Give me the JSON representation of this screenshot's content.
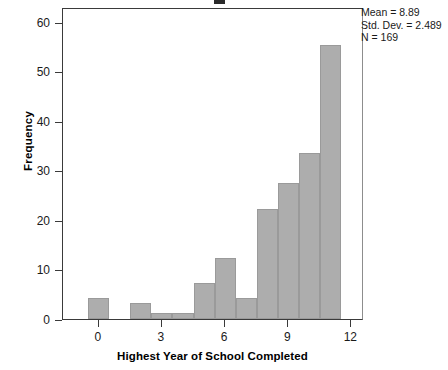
{
  "chart_data": {
    "type": "bar",
    "title_visible": false,
    "xlabel": "Highest Year of School Completed",
    "ylabel": "Frequency",
    "xlim": [
      -1.7,
      12.6
    ],
    "ylim": [
      0,
      63
    ],
    "grid": false,
    "legend": null,
    "bin_width": 1,
    "x_ticks": [
      0,
      3,
      6,
      9,
      12
    ],
    "x_tick_labels": [
      "0",
      "3",
      "6",
      "9",
      "12"
    ],
    "y_ticks": [
      0,
      10,
      20,
      30,
      40,
      50,
      60
    ],
    "y_tick_labels": [
      "0",
      "10",
      "20",
      "30",
      "40",
      "50",
      "60"
    ],
    "bar_color": "#adadad",
    "bar_edge_color": "#9a9a9a",
    "categories": [
      "0",
      "2",
      "3",
      "4",
      "5",
      "6",
      "7",
      "8",
      "9",
      "10",
      "11"
    ],
    "bin_left_edges": [
      -0.5,
      1.5,
      2.5,
      3.5,
      4.5,
      5.5,
      6.5,
      7.5,
      8.5,
      9.5,
      10.5
    ],
    "values": [
      4.2,
      3.2,
      1.2,
      1.2,
      7.2,
      12.3,
      4.3,
      22.3,
      27.4,
      33.5,
      55.4
    ],
    "bars": [
      {
        "bin_center": 0,
        "left": -0.5,
        "right": 0.5,
        "frequency": 4.2
      },
      {
        "bin_center": 2,
        "left": 1.5,
        "right": 2.5,
        "frequency": 3.2
      },
      {
        "bin_center": 3,
        "left": 2.5,
        "right": 3.5,
        "frequency": 1.2
      },
      {
        "bin_center": 4,
        "left": 3.5,
        "right": 4.5,
        "frequency": 1.2
      },
      {
        "bin_center": 5,
        "left": 4.5,
        "right": 5.5,
        "frequency": 7.2
      },
      {
        "bin_center": 6,
        "left": 5.5,
        "right": 6.5,
        "frequency": 12.3
      },
      {
        "bin_center": 7,
        "left": 6.5,
        "right": 7.5,
        "frequency": 4.3
      },
      {
        "bin_center": 8,
        "left": 7.5,
        "right": 8.5,
        "frequency": 22.3
      },
      {
        "bin_center": 9,
        "left": 8.5,
        "right": 9.5,
        "frequency": 27.4
      },
      {
        "bin_center": 10,
        "left": 9.5,
        "right": 10.5,
        "frequency": 33.5
      },
      {
        "bin_center": 11,
        "left": 10.5,
        "right": 11.5,
        "frequency": 55.4
      }
    ],
    "annotations": {
      "mean": "Mean = 8.89",
      "std_dev": "Std. Dev. = 2.489",
      "n": "N = 169"
    }
  },
  "stats": {
    "mean": "Mean = 8.89",
    "std_dev": "Std. Dev. = 2.489",
    "n": "N = 169"
  },
  "axes": {
    "x_title": "Highest Year of School Completed",
    "y_title": "Frequency"
  }
}
